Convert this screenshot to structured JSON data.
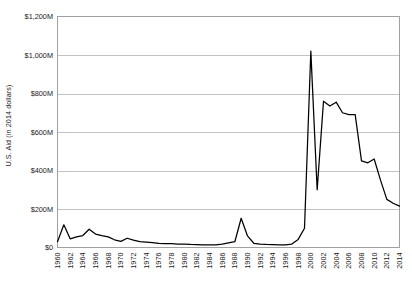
{
  "chart_data": {
    "type": "line",
    "title": "",
    "xlabel": "",
    "ylabel": "U.S. Aid (in 2014 dollars)",
    "ylim": [
      0,
      1200
    ],
    "xlim": [
      1960,
      2014
    ],
    "grid": true,
    "legend": "none",
    "y_unit": "millions of 2014 USD",
    "y_ticks": [
      0,
      200,
      400,
      600,
      800,
      1000,
      1200
    ],
    "y_tick_labels": [
      "$0",
      "$200M",
      "$400M",
      "$600M",
      "$800M",
      "$1,000M",
      "$1,200M"
    ],
    "x_tick_labels": [
      "1960",
      "1962",
      "1964",
      "1966",
      "1968",
      "1970",
      "1972",
      "1974",
      "1976",
      "1978",
      "1980",
      "1982",
      "1984",
      "1986",
      "1988",
      "1990",
      "1992",
      "1994",
      "1996",
      "1998",
      "2000",
      "2002",
      "2004",
      "2006",
      "2008",
      "2010",
      "2012",
      "2014"
    ],
    "series": [
      {
        "name": "U.S. Aid",
        "color": "#000000",
        "x": [
          1960,
          1961,
          1962,
          1963,
          1964,
          1965,
          1966,
          1967,
          1968,
          1969,
          1970,
          1971,
          1972,
          1973,
          1974,
          1975,
          1976,
          1977,
          1978,
          1979,
          1980,
          1981,
          1982,
          1983,
          1984,
          1985,
          1986,
          1987,
          1988,
          1989,
          1990,
          1991,
          1992,
          1993,
          1994,
          1995,
          1996,
          1997,
          1998,
          1999,
          2000,
          2001,
          2002,
          2003,
          2004,
          2005,
          2006,
          2007,
          2008,
          2009,
          2010,
          2011,
          2012,
          2013,
          2014
        ],
        "values": [
          30,
          118,
          45,
          55,
          62,
          95,
          70,
          62,
          55,
          40,
          32,
          48,
          38,
          30,
          28,
          25,
          22,
          20,
          20,
          18,
          18,
          16,
          15,
          14,
          14,
          14,
          18,
          24,
          30,
          152,
          60,
          22,
          18,
          16,
          15,
          14,
          14,
          18,
          42,
          100,
          1020,
          300,
          760,
          735,
          755,
          700,
          690,
          690,
          450,
          440,
          460,
          350,
          250,
          230,
          215
        ]
      }
    ]
  }
}
